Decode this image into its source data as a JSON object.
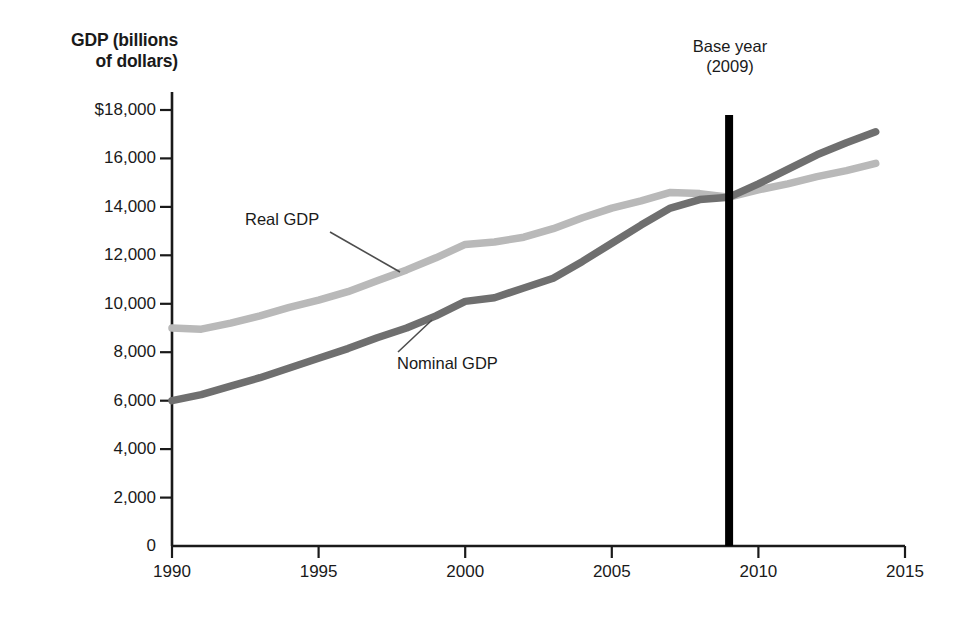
{
  "figure": {
    "background_color": "#ffffff",
    "axis_color": "#1a1a1a"
  },
  "axes": {
    "y_title_line1": "GDP (billions",
    "y_title_line2": "of dollars)",
    "y_ticks": [
      "$18,000",
      "16,000",
      "14,000",
      "12,000",
      "10,000",
      "8,000",
      "6,000",
      "4,000",
      "2,000",
      "0"
    ],
    "x_ticks": [
      "1990",
      "1995",
      "2000",
      "2005",
      "2010",
      "2015"
    ]
  },
  "annotations": {
    "base_year_line1": "Base year",
    "base_year_line2": "(2009)",
    "base_year_value": 2009,
    "real_gdp_label": "Real GDP",
    "nominal_gdp_label": "Nominal GDP"
  },
  "chart_data": {
    "type": "line",
    "title": "",
    "xlabel": "",
    "ylabel": "GDP (billions of dollars)",
    "xlim": [
      1990,
      2015
    ],
    "ylim": [
      0,
      18000
    ],
    "ytick_values": [
      18000,
      16000,
      14000,
      12000,
      10000,
      8000,
      6000,
      4000,
      2000,
      0
    ],
    "xtick_values": [
      1990,
      1995,
      2000,
      2005,
      2010,
      2015
    ],
    "grid": false,
    "legend": "inline-labels",
    "annotation_line_x": 2009,
    "x": [
      1990,
      1991,
      1992,
      1993,
      1994,
      1995,
      1996,
      1997,
      1998,
      1999,
      2000,
      2001,
      2002,
      2003,
      2004,
      2005,
      2006,
      2007,
      2008,
      2009,
      2010,
      2011,
      2012,
      2013,
      2014
    ],
    "series": [
      {
        "name": "Real GDP",
        "color": "#b9b9b9",
        "values": [
          9000,
          8950,
          9200,
          9500,
          9850,
          10150,
          10500,
          10950,
          11400,
          11900,
          12450,
          12550,
          12750,
          13100,
          13550,
          13950,
          14250,
          14600,
          14550,
          14400,
          14700,
          14950,
          15250,
          15500,
          15800
        ]
      },
      {
        "name": "Nominal GDP",
        "color": "#6f6f6f",
        "values": [
          6000,
          6250,
          6600,
          6950,
          7350,
          7750,
          8150,
          8600,
          9000,
          9500,
          10100,
          10250,
          10650,
          11050,
          11750,
          12500,
          13250,
          13950,
          14300,
          14400,
          14950,
          15550,
          16150,
          16650,
          17100
        ]
      }
    ]
  }
}
